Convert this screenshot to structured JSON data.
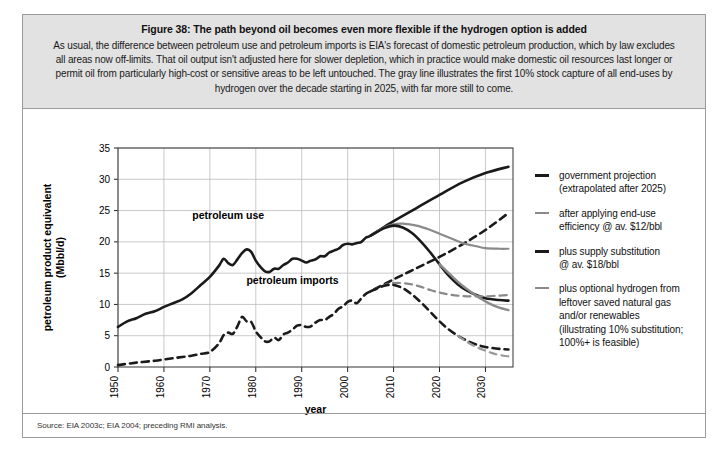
{
  "figure": {
    "title": "Figure 38: The path beyond oil becomes even more flexible if the hydrogen option is added",
    "subtitle": "As usual, the difference between petroleum use and petroleum imports is EIA's forecast of domestic petroleum production, which by law excludes all areas now off-limits. That oil output isn't adjusted here for slower depletion, which in practice would make domestic oil resources last longer or permit oil from particularly high-cost or sensitive areas to be left untouched. The gray line illustrates the first 10% stock capture of all end-uses by hydrogen over the decade starting in 2025, with far more still to come.",
    "source": "Source: EIA 2003c; EIA 2004; preceding RMI analysis."
  },
  "legend": {
    "items": [
      {
        "label": "government projection (extrapolated after 2025)",
        "line1": "government projection",
        "line2": "(extrapolated after 2025)",
        "color": "#1a1a1a",
        "width": 2.6,
        "dash": "solid"
      },
      {
        "label": "after applying end-use efficiency @ av. $12/bbl",
        "line1": "after applying end-use",
        "line2": "efficiency @ av. $12/bbl",
        "color": "#8a8a8a",
        "width": 2.0,
        "dash": "solid"
      },
      {
        "label": "plus supply substitution @ av. $18/bbl",
        "line1": "plus supply substitution",
        "line2": "@ av. $18/bbl",
        "color": "#1a1a1a",
        "width": 2.6,
        "dash": "solid"
      },
      {
        "label": "plus optional hydrogen from leftover saved natural gas and/or renewables (illustrating 10% substitution; 100%+ is feasible)",
        "line1": "plus optional hydrogen from",
        "line2": "leftover saved natural gas",
        "line3": "and/or renewables",
        "line4": "(illustrating 10% substitution;",
        "line5": "100%+ is feasible)",
        "color": "#8a8a8a",
        "width": 2.0,
        "dash": "solid"
      }
    ]
  },
  "chart_data": {
    "type": "line",
    "title": "The path beyond oil becomes even more flexible if the hydrogen option is added",
    "xlabel": "year",
    "ylabel": "petroleum product equivalent (Mbbl/d)",
    "ylabel_line1": "petroleum product equivalent",
    "ylabel_line2": "(Mbbl/d)",
    "xlim": [
      1950,
      2036
    ],
    "ylim": [
      0,
      35
    ],
    "yticks": [
      0,
      5,
      10,
      15,
      20,
      25,
      30,
      35
    ],
    "xticks": [
      1950,
      1960,
      1970,
      1980,
      1990,
      2000,
      2010,
      2020,
      2030
    ],
    "grid": true,
    "annotations": [
      {
        "text": "petroleum use",
        "x": 1974,
        "y": 23.6
      },
      {
        "text": "petroleum imports",
        "x": 1988,
        "y": 13.2
      }
    ],
    "series": [
      {
        "name": "petroleum use",
        "legend_key": "government projection (extrapolated after 2025)",
        "color": "#1a1a1a",
        "width": 2.6,
        "dash": "solid",
        "x": [
          1950,
          1952,
          1954,
          1956,
          1958,
          1960,
          1962,
          1964,
          1966,
          1968,
          1970,
          1972,
          1973,
          1974,
          1975,
          1976,
          1977,
          1978,
          1979,
          1980,
          1981,
          1982,
          1983,
          1984,
          1985,
          1986,
          1987,
          1988,
          1989,
          1990,
          1991,
          1992,
          1993,
          1994,
          1995,
          1996,
          1997,
          1998,
          1999,
          2000,
          2001,
          2002,
          2003,
          2004,
          2005,
          2010,
          2015,
          2020,
          2025,
          2030,
          2035
        ],
        "y": [
          6.4,
          7.3,
          7.8,
          8.5,
          8.9,
          9.6,
          10.2,
          10.8,
          11.8,
          13.1,
          14.4,
          16.2,
          17.3,
          16.6,
          16.3,
          17.2,
          18.2,
          18.8,
          18.4,
          17.0,
          16.0,
          15.3,
          15.2,
          15.7,
          15.7,
          16.3,
          16.7,
          17.3,
          17.3,
          17.0,
          16.7,
          17.0,
          17.2,
          17.7,
          17.7,
          18.3,
          18.6,
          18.9,
          19.5,
          19.7,
          19.6,
          19.8,
          20.0,
          20.7,
          21.0,
          23.3,
          25.4,
          27.5,
          29.5,
          31.0,
          32.0
        ]
      },
      {
        "name": "petroleum imports",
        "legend_key": "government projection (extrapolated after 2025)",
        "color": "#1a1a1a",
        "width": 2.6,
        "dash": "dashed",
        "x": [
          1950,
          1954,
          1958,
          1960,
          1962,
          1964,
          1966,
          1968,
          1970,
          1972,
          1973,
          1974,
          1975,
          1976,
          1977,
          1978,
          1979,
          1980,
          1981,
          1982,
          1983,
          1984,
          1985,
          1986,
          1987,
          1988,
          1989,
          1990,
          1991,
          1992,
          1993,
          1994,
          1995,
          1996,
          1997,
          1998,
          1999,
          2000,
          2001,
          2002,
          2003,
          2004,
          2005,
          2010,
          2015,
          2020,
          2025,
          2030,
          2035
        ],
        "y": [
          0.3,
          0.7,
          1.0,
          1.2,
          1.4,
          1.6,
          1.8,
          2.1,
          2.4,
          3.8,
          5.1,
          5.5,
          5.3,
          6.5,
          8.0,
          7.3,
          7.2,
          5.7,
          4.8,
          4.1,
          4.1,
          4.7,
          4.3,
          5.2,
          5.5,
          6.0,
          6.6,
          6.7,
          6.4,
          6.5,
          7.1,
          7.5,
          7.5,
          8.0,
          8.5,
          9.3,
          9.7,
          10.4,
          10.6,
          10.2,
          11.0,
          11.7,
          12.1,
          14.0,
          15.8,
          17.6,
          19.6,
          21.9,
          24.6
        ]
      },
      {
        "name": "after applying end-use efficiency @ av. $12/bbl",
        "legend_key": "after applying end-use efficiency @ av. $12/bbl",
        "color": "#8a8a8a",
        "width": 2.2,
        "dash": "solid",
        "x": [
          2005,
          2008,
          2010,
          2012,
          2015,
          2018,
          2020,
          2023,
          2025,
          2028,
          2030,
          2033,
          2035
        ],
        "y": [
          21.0,
          22.3,
          22.8,
          22.9,
          22.6,
          21.9,
          21.3,
          20.4,
          19.8,
          19.3,
          19.0,
          18.9,
          18.9
        ]
      },
      {
        "name": "plus supply substitution @ av. $18/bbl",
        "legend_key": "plus supply substitution @ av. $18/bbl",
        "color": "#1a1a1a",
        "width": 2.6,
        "dash": "solid",
        "x": [
          2005,
          2008,
          2010,
          2012,
          2014,
          2016,
          2018,
          2020,
          2022,
          2024,
          2026,
          2028,
          2030,
          2033,
          2035
        ],
        "y": [
          21.0,
          22.2,
          22.6,
          22.3,
          21.4,
          20.0,
          18.3,
          16.4,
          14.6,
          13.2,
          12.2,
          11.5,
          11.0,
          10.7,
          10.6
        ]
      },
      {
        "name": "plus optional hydrogen from leftover saved natural gas and/or renewables",
        "legend_key": "plus optional hydrogen from leftover saved natural gas and/or renewables (illustrating 10% substitution; 100%+ is feasible)",
        "color": "#8a8a8a",
        "width": 2.4,
        "dash": "solid",
        "x": [
          2020,
          2023,
          2025,
          2027,
          2029,
          2031,
          2033,
          2035
        ],
        "y": [
          16.4,
          14.3,
          13.0,
          11.9,
          10.9,
          10.1,
          9.5,
          9.1
        ]
      },
      {
        "name": "imports after efficiency",
        "legend_key": "after applying end-use efficiency @ av. $12/bbl",
        "color": "#8a8a8a",
        "width": 2.2,
        "dash": "dashed",
        "x": [
          2005,
          2008,
          2010,
          2012,
          2014,
          2016,
          2018,
          2020,
          2022,
          2024,
          2026,
          2028,
          2030,
          2033,
          2035
        ],
        "y": [
          12.1,
          13.1,
          13.4,
          13.4,
          13.2,
          12.8,
          12.3,
          11.9,
          11.6,
          11.4,
          11.3,
          11.3,
          11.3,
          11.4,
          11.5
        ]
      },
      {
        "name": "imports after supply substitution",
        "legend_key": "plus supply substitution @ av. $18/bbl",
        "color": "#1a1a1a",
        "width": 2.6,
        "dash": "dashed",
        "x": [
          2005,
          2008,
          2010,
          2012,
          2014,
          2016,
          2018,
          2020,
          2022,
          2024,
          2026,
          2028,
          2030,
          2033,
          2035
        ],
        "y": [
          12.1,
          13.0,
          13.1,
          12.6,
          11.6,
          10.3,
          8.8,
          7.3,
          6.0,
          5.0,
          4.2,
          3.6,
          3.2,
          2.9,
          2.8
        ]
      },
      {
        "name": "imports after hydrogen",
        "legend_key": "plus optional hydrogen from leftover saved natural gas and/or renewables (illustrating 10% substitution; 100%+ is feasible)",
        "color": "#9a9a9a",
        "width": 2.2,
        "dash": "dashed",
        "x": [
          2024,
          2026,
          2028,
          2030,
          2032,
          2034,
          2035
        ],
        "y": [
          5.0,
          4.0,
          3.2,
          2.6,
          2.1,
          1.8,
          1.7
        ]
      }
    ]
  }
}
